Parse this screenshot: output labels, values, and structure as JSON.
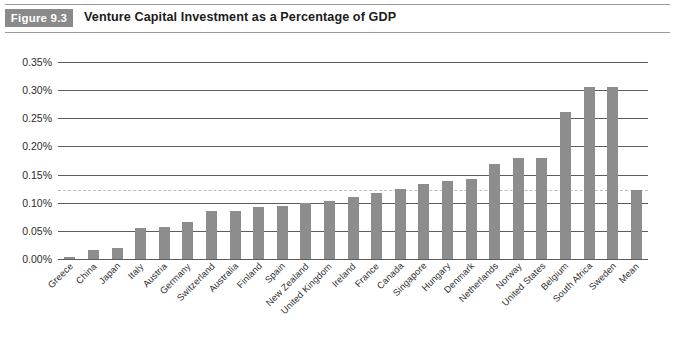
{
  "figure": {
    "badge_label": "Figure 9.3",
    "title": "Venture Capital Investment as a Percentage of GDP"
  },
  "chart_data": {
    "type": "bar",
    "title": "Venture Capital Investment as a Percentage of GDP",
    "xlabel": "",
    "ylabel": "",
    "ylim": [
      0,
      0.35
    ],
    "ytick_labels": [
      "0.35%",
      "0.30%",
      "0.25%",
      "0.20%",
      "0.15%",
      "0.10%",
      "0.05%",
      "0.00%"
    ],
    "ytick_values": [
      0.35,
      0.3,
      0.25,
      0.2,
      0.15,
      0.1,
      0.05,
      0.0
    ],
    "grid": true,
    "legend": "none",
    "reference_line": {
      "label": "mean",
      "value": 0.122,
      "style": "dashed"
    },
    "categories": [
      "Greece",
      "China",
      "Japan",
      "Italy",
      "Austria",
      "Germany",
      "Switzerland",
      "Australia",
      "Finland",
      "Spain",
      "New Zealand",
      "United Kingdom",
      "Ireland",
      "France",
      "Canada",
      "Singapore",
      "Hungary",
      "Denmark",
      "Netherlands",
      "Norway",
      "United States",
      "Belgium",
      "South Africa",
      "Sweden",
      "Mean"
    ],
    "values": [
      0.003,
      0.016,
      0.02,
      0.055,
      0.057,
      0.065,
      0.085,
      0.085,
      0.092,
      0.095,
      0.1,
      0.103,
      0.11,
      0.117,
      0.125,
      0.133,
      0.138,
      0.142,
      0.168,
      0.18,
      0.18,
      0.262,
      0.305,
      0.305,
      0.122
    ],
    "bar_color": "#8d8d8d",
    "axis_color": "#5c5c5c"
  }
}
